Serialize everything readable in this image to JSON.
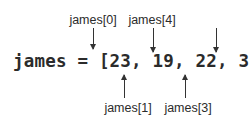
{
  "diagram": {
    "code_line": "james = [23, 19, 22, 31, 18]",
    "variable": "james",
    "values": [
      23,
      19,
      22,
      31,
      18
    ],
    "labels_top": [
      {
        "text": "james[0]",
        "index": 0
      },
      {
        "text": "james[2]",
        "index": 2
      },
      {
        "text": "james[4]",
        "index": 4
      }
    ],
    "labels_bottom": [
      {
        "text": "james[1]",
        "index": 1
      },
      {
        "text": "james[3]",
        "index": 3
      }
    ]
  }
}
